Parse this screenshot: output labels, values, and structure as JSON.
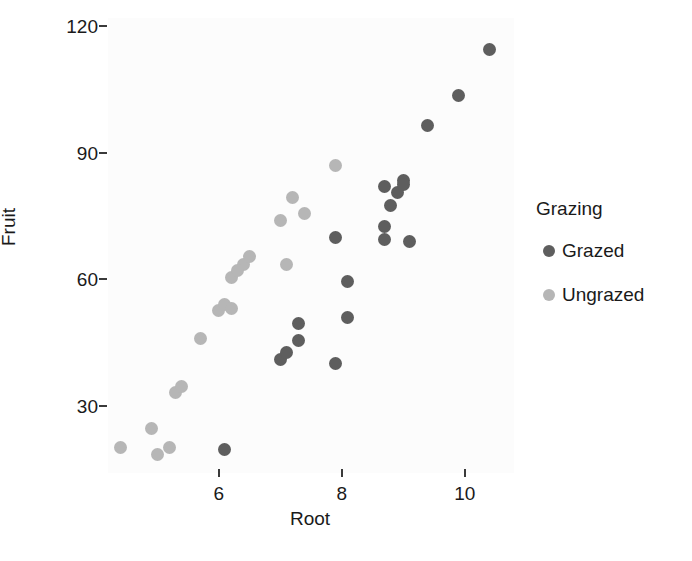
{
  "chart_data": {
    "type": "scatter",
    "title": "",
    "xlabel": "Root",
    "ylabel": "Fruit",
    "xlim": [
      4.2,
      10.8
    ],
    "ylim": [
      14,
      122
    ],
    "grid": false,
    "legend": {
      "title": "Grazing",
      "position": "right",
      "entries": [
        {
          "name": "Grazed",
          "color": "#5e5e5e"
        },
        {
          "name": "Ungrazed",
          "color": "#b6b6b6"
        }
      ]
    },
    "xticks": [
      6,
      8,
      10
    ],
    "xtick_labels": [
      "6",
      "8",
      "10"
    ],
    "yticks": [
      30,
      60,
      90,
      120
    ],
    "ytick_labels": [
      "30",
      "60",
      "90",
      "120"
    ],
    "series": [
      {
        "name": "Grazed",
        "color": "#5e5e5e",
        "points": [
          {
            "x": 6.1,
            "y": 19.5
          },
          {
            "x": 7.0,
            "y": 41.0
          },
          {
            "x": 7.1,
            "y": 42.5
          },
          {
            "x": 7.3,
            "y": 45.5
          },
          {
            "x": 7.3,
            "y": 49.5
          },
          {
            "x": 7.9,
            "y": 40.0
          },
          {
            "x": 8.1,
            "y": 51.0
          },
          {
            "x": 8.1,
            "y": 59.5
          },
          {
            "x": 7.9,
            "y": 70.0
          },
          {
            "x": 8.7,
            "y": 82.0
          },
          {
            "x": 8.9,
            "y": 80.5
          },
          {
            "x": 9.0,
            "y": 83.5
          },
          {
            "x": 9.0,
            "y": 82.5
          },
          {
            "x": 8.8,
            "y": 77.5
          },
          {
            "x": 8.7,
            "y": 72.5
          },
          {
            "x": 8.7,
            "y": 69.5
          },
          {
            "x": 9.1,
            "y": 69.0
          },
          {
            "x": 9.4,
            "y": 96.5
          },
          {
            "x": 9.9,
            "y": 103.5
          },
          {
            "x": 10.4,
            "y": 114.5
          }
        ]
      },
      {
        "name": "Ungrazed",
        "color": "#b6b6b6",
        "points": [
          {
            "x": 4.4,
            "y": 20.0
          },
          {
            "x": 4.9,
            "y": 24.5
          },
          {
            "x": 5.0,
            "y": 18.5
          },
          {
            "x": 5.2,
            "y": 20.0
          },
          {
            "x": 5.3,
            "y": 33.0
          },
          {
            "x": 5.4,
            "y": 34.5
          },
          {
            "x": 5.7,
            "y": 46.0
          },
          {
            "x": 6.0,
            "y": 52.5
          },
          {
            "x": 6.1,
            "y": 54.0
          },
          {
            "x": 6.2,
            "y": 53.0
          },
          {
            "x": 6.2,
            "y": 60.5
          },
          {
            "x": 6.4,
            "y": 63.5
          },
          {
            "x": 6.5,
            "y": 65.5
          },
          {
            "x": 6.3,
            "y": 62.0
          },
          {
            "x": 7.1,
            "y": 63.5
          },
          {
            "x": 7.0,
            "y": 74.0
          },
          {
            "x": 7.4,
            "y": 75.5
          },
          {
            "x": 7.2,
            "y": 79.5
          },
          {
            "x": 7.9,
            "y": 87.0
          }
        ]
      }
    ]
  },
  "axes": {
    "x": {
      "title": "Root"
    },
    "y": {
      "title": "Fruit"
    }
  }
}
